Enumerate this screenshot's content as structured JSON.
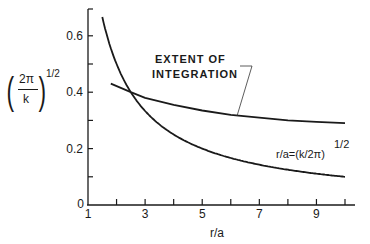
{
  "chart_data": {
    "type": "line",
    "title": "",
    "xlabel": "r/a",
    "ylabel": "(2π/k)^1/2",
    "ylabel_parts": {
      "numerator": "2π",
      "denominator": "k",
      "exponent": "1/2"
    },
    "xlim": [
      1,
      10
    ],
    "ylim": [
      0,
      0.7
    ],
    "grid": false,
    "x_ticks": [
      1,
      2,
      3,
      4,
      5,
      6,
      7,
      8,
      9,
      10
    ],
    "x_tick_labels": [
      "1",
      "3",
      "5",
      "7",
      "9"
    ],
    "y_ticks": [
      0,
      0.1,
      0.2,
      0.3,
      0.4,
      0.5,
      0.6
    ],
    "y_tick_labels": [
      "0",
      "0.2",
      "0.4",
      "0.6"
    ],
    "series": [
      {
        "name": "r/a=(k/2π)^1/2",
        "x": [
          1.5,
          2,
          2.5,
          3,
          4,
          5,
          6,
          7,
          8,
          9,
          10
        ],
        "values": [
          0.667,
          0.5,
          0.4,
          0.333,
          0.25,
          0.2,
          0.167,
          0.143,
          0.125,
          0.111,
          0.1
        ]
      },
      {
        "name": "Extent of integration",
        "x": [
          1.8,
          2.5,
          3,
          4,
          5,
          6,
          7,
          8,
          9,
          10
        ],
        "values": [
          0.43,
          0.4,
          0.38,
          0.355,
          0.335,
          0.32,
          0.31,
          0.3,
          0.295,
          0.29
        ]
      }
    ],
    "annotations": [
      {
        "text_line1": "EXTENT OF",
        "text_line2": "INTEGRATION",
        "points_to": "upper curve near r/a=6"
      },
      {
        "text": "r/a=(k/2π)",
        "exponent": "1/2",
        "points_to": "lower curve"
      }
    ]
  }
}
